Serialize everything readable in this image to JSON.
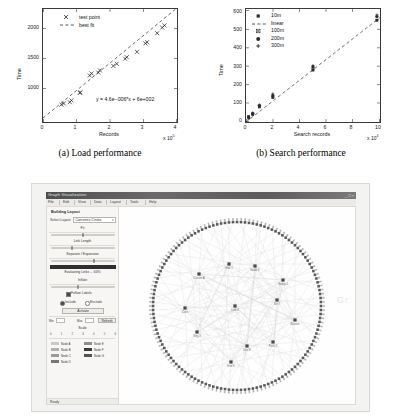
{
  "figure": {
    "panel_a": {
      "caption": "(a) Load performance",
      "equation": "y = 4.6e−006*x + 6e+002",
      "legend": [
        {
          "label": "test point",
          "symbol": "x-marker"
        },
        {
          "label": "best fit",
          "symbol": "dashed-line"
        }
      ]
    },
    "panel_b": {
      "caption": "(b) Search performance",
      "legend": [
        {
          "label": "10m",
          "symbol": "square-marker"
        },
        {
          "label": "linear",
          "symbol": "dashed-line"
        },
        {
          "label": "100m",
          "symbol": "x-square-marker"
        },
        {
          "label": "200m",
          "symbol": "circle-marker"
        },
        {
          "label": "300m",
          "symbol": "plus-marker"
        }
      ]
    }
  },
  "chart_data": [
    {
      "type": "scatter",
      "title": "(a) Load performance",
      "xlabel": "Records",
      "ylabel": "Time",
      "x_multiplier": "x 10^5",
      "y_multiplier": "",
      "xlim": [
        0,
        4
      ],
      "ylim": [
        600,
        2250
      ],
      "xticks": [
        0,
        1,
        2,
        3,
        4
      ],
      "yticks": [
        1000,
        1500,
        2000
      ],
      "grid": false,
      "legend_position": "top-left",
      "annotation": "y = 4.6e−006*x + 6e+002",
      "series": [
        {
          "name": "test point",
          "marker": "x",
          "x": [
            0.55,
            0.62,
            0.8,
            0.85,
            1.1,
            1.12,
            1.4,
            1.45,
            1.65,
            1.7,
            2.1,
            2.2,
            2.45,
            2.5,
            2.8,
            3.05,
            3.1,
            3.4,
            3.55,
            3.62
          ],
          "y": [
            860,
            880,
            900,
            930,
            1055,
            1065,
            1345,
            1380,
            1395,
            1430,
            1505,
            1540,
            1625,
            1650,
            1740,
            1880,
            1900,
            2050,
            2145,
            2180
          ]
        },
        {
          "name": "best fit",
          "marker": "dashed-line",
          "x": [
            0,
            4
          ],
          "y": [
            600,
            2440
          ]
        }
      ]
    },
    {
      "type": "scatter",
      "title": "(b) Search performance",
      "xlabel": "Search records",
      "ylabel": "Time",
      "x_multiplier": "x 10^4",
      "y_multiplier": "",
      "xlim": [
        0,
        10
      ],
      "ylim": [
        0,
        600
      ],
      "xticks": [
        0,
        2,
        4,
        6,
        8,
        10
      ],
      "yticks": [
        0,
        100,
        200,
        300,
        400,
        500,
        600
      ],
      "grid": false,
      "legend_position": "top-left",
      "categories": [
        0.2,
        0.5,
        1.0,
        2.0,
        5.0,
        10.0
      ],
      "series": [
        {
          "name": "10m",
          "marker": "square",
          "x": [
            0.2,
            0.5,
            1.0,
            2.0,
            5.0,
            10.0
          ],
          "y": [
            12,
            40,
            82,
            126,
            272,
            535
          ]
        },
        {
          "name": "linear",
          "marker": "dashed-line",
          "x": [
            0,
            10
          ],
          "y": [
            0,
            555
          ]
        },
        {
          "name": "100m",
          "marker": "x-square",
          "x": [
            0.2,
            0.5,
            1.0,
            2.0,
            5.0,
            10.0
          ],
          "y": [
            15,
            44,
            86,
            133,
            285,
            552
          ]
        },
        {
          "name": "200m",
          "marker": "circle",
          "x": [
            0.2,
            0.5,
            1.0,
            2.0,
            5.0,
            10.0
          ],
          "y": [
            18,
            46,
            88,
            140,
            292,
            560
          ]
        },
        {
          "name": "300m",
          "marker": "plus",
          "x": [
            0.2,
            0.5,
            1.0,
            2.0,
            5.0,
            10.0
          ],
          "y": [
            22,
            48,
            90,
            150,
            300,
            568
          ]
        }
      ]
    }
  ],
  "screenshot": {
    "window_title": "Graph Visualization",
    "window_buttons": "_ □ ×",
    "toolbar_items": [
      "File",
      "Edit",
      "View",
      "Data",
      "Layout",
      "Tools",
      "Help"
    ],
    "sidebar": {
      "title": "Building Layout",
      "select_label": "Select Layout",
      "select_value": "Concentric Circles",
      "section_1_label": "Fit",
      "section_2_label": "Link Length",
      "section_3_label": "Separate / Expansion",
      "progress_label": "Evaluating Links ... 64%",
      "section_4_label": "Inflate",
      "checkbox_1_label": "Follow Labels",
      "radio_1_label": "Include",
      "radio_2_label": "Exclude",
      "primary_button": "Activate",
      "field_label": "Min",
      "field_value": "0",
      "field_label_2": "Max",
      "field_value_2": "1",
      "secondary_button": "Refresh",
      "scale_label": "Scale",
      "scale_ticks": [
        "0",
        "1",
        "2",
        "3",
        "4",
        "5",
        "6"
      ],
      "legend_title": "",
      "legend_items": [
        {
          "label": "Node A",
          "color": "#c8c8c8"
        },
        {
          "label": "Node E",
          "color": "#8f8f8f"
        },
        {
          "label": "Node B",
          "color": "#b0b0b0"
        },
        {
          "label": "Node F",
          "color": "#3a3a3a"
        },
        {
          "label": "Node C",
          "color": "#9a9a9a"
        },
        {
          "label": "Node G",
          "color": "#545454"
        },
        {
          "label": "Node D",
          "color": "#767676"
        }
      ],
      "status": "Ready"
    },
    "graph": {
      "layout": "radial-circular",
      "perimeter_node_count": 132,
      "inner_node_count": 12,
      "inner_node_labels": [
        "Cluster A",
        "Hub 1",
        "Node X",
        "Group 2",
        "Core",
        "Link 4",
        "Set 7",
        "Branch",
        "Seg 3",
        "Unit 9",
        "Path 5",
        "End 8"
      ],
      "node_color": "#5a5a5a",
      "edge_color": "#d4d4d4",
      "watermark": "Gr"
    }
  }
}
